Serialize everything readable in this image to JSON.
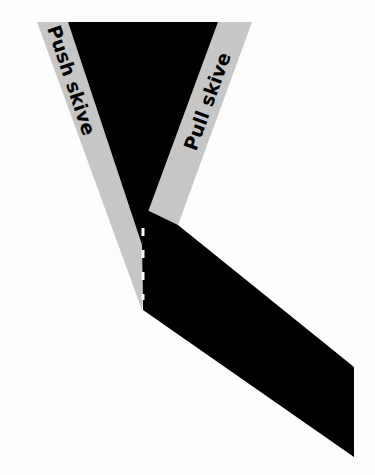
{
  "diagram": {
    "labels": {
      "push": "Push skive",
      "pull": "Pull skive"
    },
    "colors": {
      "background": "#fdfdfd",
      "band": "#c6c6c6",
      "material": "#000000",
      "seam_marks": "#ffffff"
    }
  }
}
